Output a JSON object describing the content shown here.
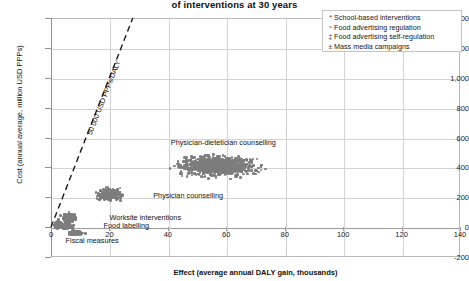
{
  "chart_data": {
    "type": "scatter",
    "title": "of interventions at 30 years",
    "xlabel": "Effect (average annual DALY gain, thousands)",
    "ylabel": "Cost (annual average, million USD PPPs)",
    "xlim": [
      0,
      140
    ],
    "ylim": [
      -200,
      1400
    ],
    "xticks": [
      0,
      20,
      40,
      60,
      80,
      100,
      120,
      140
    ],
    "xtick_labels": [
      "0",
      "20",
      "40",
      "60",
      "80",
      "100",
      "120",
      "140"
    ],
    "yticks": [
      -200,
      0,
      200,
      400,
      600,
      800,
      1000,
      1200,
      1400
    ],
    "ytick_labels": [
      "-200",
      "0",
      "200",
      "400",
      "600",
      "800",
      "1,000",
      "1,200",
      "1,400"
    ],
    "grid": true,
    "legend_position": "top-right",
    "legend": [
      {
        "marker": "*",
        "label": "School-based interventions"
      },
      {
        "marker": "ˣ",
        "label": "Food advertising regulation"
      },
      {
        "marker": "‡",
        "label": "Food advertising self-regulation"
      },
      {
        "marker": "±",
        "label": "Mass media campaigns"
      }
    ],
    "reference_line": {
      "label": "50 000 USD PPPs/DALY",
      "style": "dashed",
      "from": [
        0,
        0
      ],
      "to": [
        28,
        1400
      ],
      "slope": 50
    },
    "annotations": [
      {
        "text": "Physician-dietetician counselling",
        "x": 41,
        "y": 560
      },
      {
        "text": "Physician counselling",
        "x": 35,
        "y": 210
      },
      {
        "text": "Worksite interventions",
        "x": 20,
        "y": 60
      },
      {
        "text": "Food labelling",
        "x": 18,
        "y": 10
      },
      {
        "text": "Fiscal measures",
        "x": 5,
        "y": -90
      }
    ],
    "marker_color": "#7d7d7d",
    "clusters": [
      {
        "name": "Physician-dietetician counselling",
        "x_center": 57,
        "y_center": 415,
        "x_spread": 13,
        "y_spread": 70,
        "n": 900,
        "x_range": [
          34,
          84
        ],
        "y_range": [
          270,
          560
        ]
      },
      {
        "name": "Physician counselling",
        "x_center": 20,
        "y_center": 225,
        "x_spread": 4,
        "y_spread": 38,
        "n": 320,
        "x_range": [
          13,
          28
        ],
        "y_range": [
          140,
          320
        ]
      },
      {
        "name": "Worksite interventions",
        "x_center": 6,
        "y_center": 70,
        "x_spread": 2.2,
        "y_spread": 30,
        "n": 200,
        "x_range": [
          2,
          11
        ],
        "y_range": [
          0,
          150
        ]
      },
      {
        "name": "Food labelling",
        "x_center": 5,
        "y_center": 15,
        "x_spread": 2,
        "y_spread": 16,
        "n": 180,
        "x_range": [
          1,
          10
        ],
        "y_range": [
          -30,
          60
        ]
      },
      {
        "name": "Fiscal measures",
        "x_center": 8,
        "y_center": -30,
        "x_spread": 2.6,
        "y_spread": 14,
        "n": 150,
        "x_range": [
          3,
          14
        ],
        "y_range": [
          -70,
          10
        ]
      },
      {
        "name": "School-based interventions",
        "x_center": 2,
        "y_center": 30,
        "x_spread": 1.2,
        "y_spread": 28,
        "n": 90,
        "x_range": [
          0.3,
          5
        ],
        "y_range": [
          -25,
          95
        ]
      }
    ]
  }
}
